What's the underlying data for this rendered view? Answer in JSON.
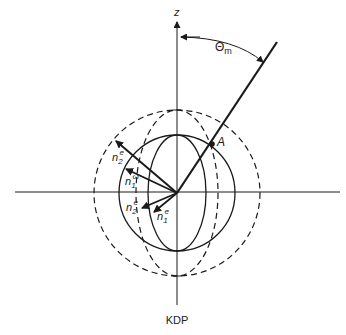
{
  "figure": {
    "caption": "KDP",
    "axis_label_z": "z",
    "angle_label": "Θ",
    "angle_subscript": "m",
    "point_label": "A",
    "vectors": [
      {
        "base": "n",
        "sub": "2",
        "sup": "e"
      },
      {
        "base": "n",
        "sub": "1",
        "sup": "ω"
      },
      {
        "base": "n",
        "sub": "2",
        "sup": "e"
      },
      {
        "base": "n",
        "sub": "1",
        "sup": "e"
      }
    ]
  },
  "colors": {
    "ink": "#1a1a1a",
    "background": "#ffffff"
  }
}
